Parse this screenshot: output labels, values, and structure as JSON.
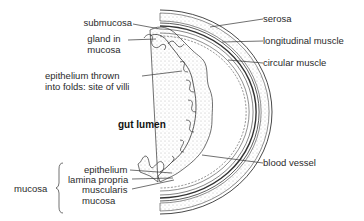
{
  "diagram": {
    "type": "cross-section",
    "center_label": "gut lumen",
    "labels_left": [
      {
        "id": "submucosa",
        "text": "submucosa"
      },
      {
        "id": "gland",
        "lines": [
          "gland in",
          "mucosa"
        ]
      },
      {
        "id": "epithelium-folds",
        "lines": [
          "epithelium thrown",
          "into folds: site of villi"
        ]
      }
    ],
    "labels_right": [
      {
        "id": "serosa",
        "text": "serosa"
      },
      {
        "id": "longitudinal-muscle",
        "text": "longitudinal muscle"
      },
      {
        "id": "circular-muscle",
        "text": "circular muscle"
      },
      {
        "id": "blood-vessel",
        "text": "blood vessel"
      }
    ],
    "mucosa_group": {
      "bracket_label": "mucosa",
      "items": [
        {
          "id": "epithelium",
          "text": "epithelium"
        },
        {
          "id": "lamina-propria",
          "text": "lamina propria"
        },
        {
          "id": "muscularis-mucosa",
          "lines": [
            "muscularis",
            "mucosa"
          ]
        }
      ]
    },
    "colors": {
      "line": "#333333",
      "stipple": "#888888",
      "background": "#ffffff"
    }
  }
}
